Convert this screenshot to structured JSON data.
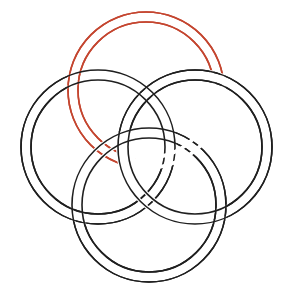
{
  "figure": {
    "background_color": "#ffffff",
    "width": 290,
    "height": 301,
    "center": {
      "x": 146,
      "y": 152
    },
    "band_gap": 10,
    "stroke_width": 1.6,
    "colors": {
      "red": "#c4452f",
      "black": "#1f1f1f",
      "background": "#ffffff"
    },
    "bands": [
      {
        "name": "north-band",
        "color_key": "red",
        "color": "#c4452f",
        "center": {
          "x": 146,
          "y": 90
        },
        "radius_outer": 78,
        "radius_inner": 68
      },
      {
        "name": "west-band",
        "color_key": "black",
        "color": "#1f1f1f",
        "center": {
          "x": 98,
          "y": 147
        },
        "radius_outer": 77,
        "radius_inner": 67
      },
      {
        "name": "east-band",
        "color_key": "black",
        "color": "#1f1f1f",
        "center": {
          "x": 195,
          "y": 147
        },
        "radius_outer": 77,
        "radius_inner": 67
      },
      {
        "name": "south-band",
        "color_key": "black",
        "color": "#1f1f1f",
        "center": {
          "x": 149,
          "y": 205
        },
        "radius_outer": 77,
        "radius_inner": 67
      }
    ],
    "over_under_order": [
      "north-band",
      "west-band",
      "south-band",
      "east-band"
    ]
  }
}
